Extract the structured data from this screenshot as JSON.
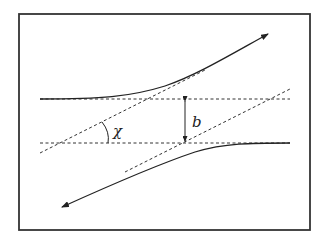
{
  "figure": {
    "labels": {
      "angle": "χ",
      "impact_parameter": "b"
    },
    "colors": {
      "stroke": "#222222",
      "background": "#ffffff"
    },
    "elements": [
      "frame",
      "upper-incoming-trajectory",
      "lower-trajectory",
      "upper-dashed-horizontal",
      "lower-dashed-horizontal",
      "upper-dashed-asymptote",
      "lower-dashed-asymptote",
      "impact-parameter-arrow",
      "angle-arc"
    ]
  }
}
